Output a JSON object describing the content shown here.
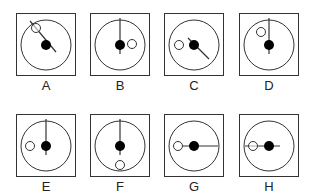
{
  "figure": {
    "colors": {
      "stroke": "#333333",
      "dot": "#000000",
      "background": "#ffffff"
    },
    "panels": [
      {
        "label": "A",
        "x": 16,
        "y": 13,
        "line": {
          "x1": 14,
          "y1": 8,
          "x2": 40,
          "y2": 39
        },
        "hollow": {
          "cx": 20,
          "cy": 15
        }
      },
      {
        "label": "B",
        "x": 90,
        "y": 13,
        "line": {
          "x1": 30,
          "y1": 5,
          "x2": 30,
          "y2": 41
        },
        "hollow": {
          "cx": 42,
          "cy": 31
        }
      },
      {
        "label": "C",
        "x": 164,
        "y": 13,
        "line": {
          "x1": 24,
          "y1": 25,
          "x2": 45,
          "y2": 46
        },
        "hollow": {
          "cx": 15,
          "cy": 32
        }
      },
      {
        "label": "D",
        "x": 239,
        "y": 13,
        "line": {
          "x1": 30,
          "y1": 5,
          "x2": 30,
          "y2": 41
        },
        "hollow": {
          "cx": 22,
          "cy": 19
        }
      },
      {
        "label": "E",
        "x": 16,
        "y": 114,
        "line": {
          "x1": 30,
          "y1": 5,
          "x2": 30,
          "y2": 41
        },
        "hollow": {
          "cx": 14,
          "cy": 32
        }
      },
      {
        "label": "F",
        "x": 90,
        "y": 114,
        "line": {
          "x1": 30,
          "y1": 5,
          "x2": 30,
          "y2": 41
        },
        "hollow": {
          "cx": 30,
          "cy": 51
        }
      },
      {
        "label": "G",
        "x": 164,
        "y": 114,
        "line": {
          "x1": 19,
          "y1": 32,
          "x2": 54,
          "y2": 32
        },
        "hollow": {
          "cx": 14,
          "cy": 32
        }
      },
      {
        "label": "H",
        "x": 239,
        "y": 114,
        "line": {
          "x1": 6,
          "y1": 32,
          "x2": 41,
          "y2": 32
        },
        "hollow": {
          "cx": 14,
          "cy": 32
        }
      }
    ]
  }
}
